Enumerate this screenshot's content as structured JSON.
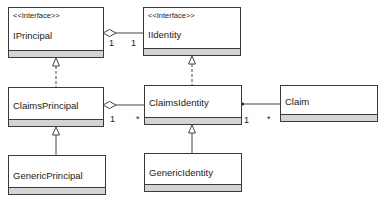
{
  "diagram": {
    "type": "uml-class-diagram",
    "classes": [
      {
        "id": "IPrincipal",
        "stereotype": "<<Interface>>",
        "name": "IPrincipal"
      },
      {
        "id": "IIdentity",
        "stereotype": "<<Interface>>",
        "name": "IIdentity"
      },
      {
        "id": "ClaimsPrincipal",
        "stereotype": "",
        "name": "ClaimsPrincipal"
      },
      {
        "id": "ClaimsIdentity",
        "stereotype": "",
        "name": "ClaimsIdentity"
      },
      {
        "id": "Claim",
        "stereotype": "",
        "name": "Claim"
      },
      {
        "id": "GenericPrincipal",
        "stereotype": "",
        "name": "GenericPrincipal"
      },
      {
        "id": "GenericIdentity",
        "stereotype": "",
        "name": "GenericIdentity"
      }
    ],
    "relations": [
      {
        "from": "IPrincipal",
        "to": "IIdentity",
        "kind": "aggregation",
        "from_mult": "1",
        "to_mult": "1"
      },
      {
        "from": "ClaimsPrincipal",
        "to": "IPrincipal",
        "kind": "realization"
      },
      {
        "from": "ClaimsIdentity",
        "to": "IIdentity",
        "kind": "realization"
      },
      {
        "from": "ClaimsPrincipal",
        "to": "ClaimsIdentity",
        "kind": "aggregation",
        "from_mult": "1",
        "to_mult": "*"
      },
      {
        "from": "ClaimsIdentity",
        "to": "Claim",
        "kind": "association",
        "from_mult": "1",
        "to_mult": "*"
      },
      {
        "from": "GenericPrincipal",
        "to": "ClaimsPrincipal",
        "kind": "generalization"
      },
      {
        "from": "GenericIdentity",
        "to": "ClaimsIdentity",
        "kind": "generalization"
      }
    ],
    "multiplicities": {
      "iprincipal_side": "1",
      "iidentity_side": "1",
      "claimsprincipal_side": "1",
      "claimsidentity_left": "*",
      "claimsidentity_right": "1",
      "claim_side": "*"
    }
  }
}
